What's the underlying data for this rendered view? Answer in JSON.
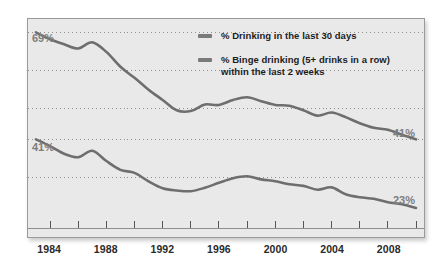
{
  "legend": {
    "position": "top-right",
    "entries": [
      {
        "label": "% Drinking in the last 30 days",
        "color": "#7a7a7a"
      },
      {
        "label": "% Binge drinking (5+ drinks in a row) within the last 2 weeks",
        "color": "#7a7a7a"
      }
    ]
  },
  "axis": {
    "x_tick_labels": [
      "1984",
      "1988",
      "1992",
      "1996",
      "2000",
      "2004",
      "2008"
    ]
  },
  "annotations": {
    "start_upper": "69%",
    "start_lower": "41%",
    "end_upper": "41%",
    "end_lower": "23%"
  },
  "chart_data": {
    "type": "line",
    "title": "",
    "subtitle": "",
    "xlabel": "",
    "ylabel": "",
    "xlim": [
      1983,
      2010
    ],
    "ylim": [
      18,
      72
    ],
    "grid": true,
    "grid_axis": "y",
    "grid_style": "dotted",
    "grid_values": [
      69,
      59,
      49,
      41,
      31
    ],
    "legend_position": "top-right",
    "x_ticks_major": [
      1984,
      1988,
      1992,
      1996,
      2000,
      2004,
      2008
    ],
    "x_ticks_minor": [
      1984,
      1986,
      1988,
      1990,
      1992,
      1994,
      1996,
      1998,
      2000,
      2002,
      2004,
      2006,
      2008,
      2010
    ],
    "x": [
      1983,
      1984,
      1985,
      1986,
      1987,
      1988,
      1989,
      1990,
      1991,
      1992,
      1993,
      1994,
      1995,
      1996,
      1997,
      1998,
      1999,
      2000,
      2001,
      2002,
      2003,
      2004,
      2005,
      2006,
      2007,
      2008,
      2009,
      2010
    ],
    "series": [
      {
        "name": "% Drinking in the last 30 days",
        "color": "#6e6e6e",
        "label_start": "69%",
        "label_end": "41%",
        "values": [
          69.0,
          67.2,
          65.9,
          64.8,
          66.4,
          63.9,
          60.0,
          57.1,
          54.0,
          51.3,
          48.6,
          48.4,
          50.1,
          50.0,
          51.3,
          52.0,
          51.0,
          50.0,
          49.8,
          48.6,
          47.2,
          48.0,
          46.8,
          45.2,
          44.0,
          43.5,
          42.2,
          41.0
        ]
      },
      {
        "name": "% Binge drinking (5+ drinks in a row) within the last 2 weeks",
        "color": "#6e6e6e",
        "label_start": "41%",
        "label_end": "23%",
        "values": [
          41.0,
          39.2,
          37.2,
          36.3,
          38.0,
          35.3,
          33.0,
          32.2,
          30.0,
          28.2,
          27.6,
          27.4,
          28.3,
          29.6,
          30.8,
          31.3,
          30.5,
          30.0,
          29.2,
          28.8,
          27.8,
          28.4,
          26.6,
          25.8,
          25.4,
          24.5,
          24.0,
          23.0
        ]
      }
    ]
  }
}
